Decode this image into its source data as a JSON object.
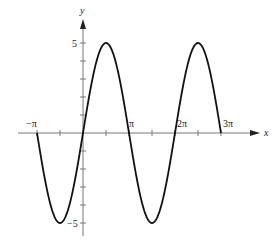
{
  "chart_data": {
    "type": "line",
    "title": "",
    "function": "y = 5 sin x",
    "xlabel": "x",
    "ylabel": "y",
    "xlim": [
      -3.14159,
      9.42478
    ],
    "ylim": [
      -5,
      5
    ],
    "grid": false,
    "legend": null,
    "x_ticks": [
      {
        "value": -3.14159,
        "label": "−π"
      },
      {
        "value": -1.5708,
        "label": ""
      },
      {
        "value": 0,
        "label": ""
      },
      {
        "value": 1.5708,
        "label": ""
      },
      {
        "value": 3.14159,
        "label": "π"
      },
      {
        "value": 4.71239,
        "label": ""
      },
      {
        "value": 6.28319,
        "label": "2π"
      },
      {
        "value": 7.85398,
        "label": ""
      },
      {
        "value": 9.42478,
        "label": "3π"
      }
    ],
    "y_ticks": [
      {
        "value": 5,
        "label": "5"
      },
      {
        "value": 4,
        "label": ""
      },
      {
        "value": 3,
        "label": ""
      },
      {
        "value": 2,
        "label": ""
      },
      {
        "value": 1,
        "label": ""
      },
      {
        "value": -1,
        "label": ""
      },
      {
        "value": -2,
        "label": ""
      },
      {
        "value": -3,
        "label": ""
      },
      {
        "value": -4,
        "label": ""
      },
      {
        "value": -5,
        "label": "−5"
      }
    ],
    "series": [
      {
        "name": "5 sin x",
        "x": [
          -3.14159,
          -2.35619,
          -1.5708,
          -0.785398,
          0,
          0.785398,
          1.5708,
          2.35619,
          3.14159,
          3.92699,
          4.71239,
          5.49779,
          6.28319,
          7.06858,
          7.85398,
          8.63938,
          9.42478
        ],
        "values": [
          0,
          -3.54,
          -5,
          -3.54,
          0,
          3.54,
          5,
          3.54,
          0,
          -3.54,
          -5,
          -3.54,
          0,
          3.54,
          5,
          3.54,
          0
        ]
      }
    ]
  },
  "axes": {
    "x_label": "x",
    "y_label": "y",
    "labels": {
      "neg_pi": "−π",
      "pi": "π",
      "two_pi": "2π",
      "three_pi": "3π",
      "y_max": "5",
      "y_min": "−5"
    }
  },
  "style": {
    "curve_color": "#111111",
    "axis_color": "#777777"
  }
}
